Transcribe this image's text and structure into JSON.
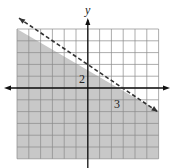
{
  "chart_data": {
    "type": "area",
    "title": "",
    "boundary_line": {
      "style": "dashed",
      "points": [
        [
          0,
          2
        ],
        [
          3,
          0
        ]
      ],
      "equation": "2x + 3y = 6",
      "slope": -0.6667,
      "y_intercept": 2,
      "x_intercept": 3
    },
    "shaded_region": "below",
    "inequality": "2x + 3y < 6",
    "xlabel": "",
    "ylabel": "y",
    "annotations": [
      {
        "text": "2",
        "x": 0,
        "y": 2,
        "meaning": "y-intercept"
      },
      {
        "text": "3",
        "x": 3,
        "y": 0,
        "meaning": "x-intercept"
      }
    ],
    "xlim": [
      -6,
      6
    ],
    "ylim": [
      -6,
      5
    ],
    "grid": true,
    "grid_step": 1,
    "legend": null
  },
  "axes": {
    "y_label": "y"
  },
  "labels": {
    "y_intercept": "2",
    "x_intercept": "3"
  },
  "colors": {
    "shade": "#c8c8c8",
    "grid": "#8a8a8a",
    "axis": "#111111",
    "line": "#333333",
    "background": "#ffffff"
  }
}
